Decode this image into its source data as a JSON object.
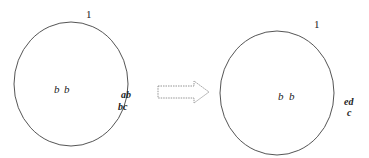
{
  "diagram": {
    "left": {
      "top_label": "1",
      "center_labels": [
        "b",
        "b"
      ],
      "edge_labels": [
        "ab",
        "bc"
      ]
    },
    "arrow": {
      "style": "dashed-outline",
      "direction": "right"
    },
    "right": {
      "top_label": "1",
      "center_labels": [
        "b",
        "b"
      ],
      "edge_labels": [
        "ed",
        "c"
      ]
    },
    "colors": {
      "stroke": "#555555",
      "arrow_stroke": "#888888",
      "text": "#222222"
    }
  }
}
